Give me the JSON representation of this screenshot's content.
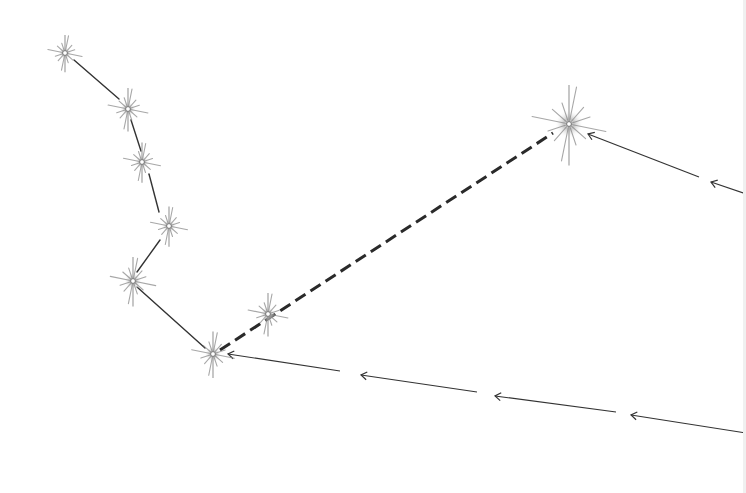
{
  "diagram": {
    "type": "constellation-sketch",
    "background": "#ffffff",
    "line_color": "#333333",
    "star_color": "#8a8a8a",
    "stars": [
      {
        "id": "s1",
        "x": 65,
        "y": 53,
        "size": 12
      },
      {
        "id": "s2",
        "x": 128,
        "y": 109,
        "size": 14
      },
      {
        "id": "s3",
        "x": 142,
        "y": 162,
        "size": 13
      },
      {
        "id": "s4",
        "x": 169,
        "y": 226,
        "size": 13
      },
      {
        "id": "s5",
        "x": 133,
        "y": 281,
        "size": 16
      },
      {
        "id": "s6",
        "x": 268,
        "y": 314,
        "size": 14
      },
      {
        "id": "s7",
        "x": 213,
        "y": 354,
        "size": 15
      },
      {
        "id": "s8",
        "x": 569,
        "y": 124,
        "size": 26
      }
    ],
    "solid_lines": [
      {
        "x1": 74,
        "y1": 60,
        "x2": 119,
        "y2": 99
      },
      {
        "x1": 131,
        "y1": 120,
        "x2": 141,
        "y2": 151
      },
      {
        "x1": 149,
        "y1": 174,
        "x2": 159,
        "y2": 212
      },
      {
        "x1": 160,
        "y1": 240,
        "x2": 137,
        "y2": 272
      },
      {
        "x1": 137,
        "y1": 287,
        "x2": 205,
        "y2": 348
      }
    ],
    "dashed_lines": [
      {
        "x1": 220,
        "y1": 350,
        "x2": 553,
        "y2": 133
      }
    ],
    "arrow_segments": [
      {
        "x1": 699,
        "y1": 177,
        "x2": 588,
        "y2": 134
      },
      {
        "x1": 746,
        "y1": 194,
        "x2": 711,
        "y2": 182
      },
      {
        "x1": 340,
        "y1": 371,
        "x2": 228,
        "y2": 354
      },
      {
        "x1": 477,
        "y1": 392,
        "x2": 361,
        "y2": 375
      },
      {
        "x1": 616,
        "y1": 412,
        "x2": 495,
        "y2": 396
      },
      {
        "x1": 746,
        "y1": 433,
        "x2": 631,
        "y2": 415
      }
    ]
  }
}
